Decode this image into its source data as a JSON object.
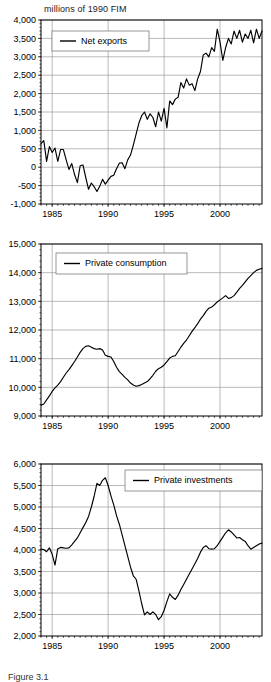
{
  "figure": {
    "axis_units_title": "millions of 1990 FIM",
    "caption": "Figure 3.1"
  },
  "chart_data": [
    {
      "type": "line",
      "title": "millions of 1990 FIM",
      "xlabel": "",
      "ylabel": "millions of 1990 FIM",
      "grid": true,
      "legend_position": "top-left",
      "legend": [
        "Net exports"
      ],
      "xlim": [
        1984.0,
        2003.75
      ],
      "ylim": [
        -1000,
        4000
      ],
      "yticks": [
        -1000,
        -500,
        0,
        500,
        1000,
        1500,
        2000,
        2500,
        3000,
        3500,
        4000
      ],
      "ytick_labels": [
        "-1,000",
        "-500",
        "0",
        "500",
        "1,000",
        "1,500",
        "2,000",
        "2,500",
        "3,000",
        "3,500",
        "4,000"
      ],
      "xticks": [
        1985,
        1990,
        1995,
        2000
      ],
      "xtick_labels": [
        "1985",
        "1990",
        "1995",
        "2000"
      ],
      "series": [
        {
          "name": "Net exports",
          "x": [
            1984.0,
            1984.25,
            1984.5,
            1984.75,
            1985.0,
            1985.25,
            1985.5,
            1985.75,
            1986.0,
            1986.25,
            1986.5,
            1986.75,
            1987.0,
            1987.25,
            1987.5,
            1987.75,
            1988.0,
            1988.25,
            1988.5,
            1988.75,
            1989.0,
            1989.25,
            1989.5,
            1989.75,
            1990.0,
            1990.25,
            1990.5,
            1990.75,
            1991.0,
            1991.25,
            1991.5,
            1991.75,
            1992.0,
            1992.25,
            1992.5,
            1992.75,
            1993.0,
            1993.25,
            1993.5,
            1993.75,
            1994.0,
            1994.25,
            1994.5,
            1994.75,
            1995.0,
            1995.25,
            1995.5,
            1995.75,
            1996.0,
            1996.25,
            1996.5,
            1996.75,
            1997.0,
            1997.25,
            1997.5,
            1997.75,
            1998.0,
            1998.25,
            1998.5,
            1998.75,
            1999.0,
            1999.25,
            1999.5,
            1999.75,
            2000.0,
            2000.25,
            2000.5,
            2000.75,
            2001.0,
            2001.25,
            2001.5,
            2001.75,
            2002.0,
            2002.25,
            2002.5,
            2002.75,
            2003.0,
            2003.25,
            2003.5,
            2003.75
          ],
          "values": [
            640,
            720,
            160,
            560,
            400,
            520,
            160,
            480,
            480,
            200,
            -60,
            100,
            -200,
            -420,
            40,
            60,
            -280,
            -600,
            -430,
            -530,
            -660,
            -520,
            -330,
            -460,
            -350,
            -250,
            -220,
            -40,
            110,
            120,
            -40,
            200,
            330,
            600,
            900,
            1200,
            1400,
            1500,
            1300,
            1450,
            1350,
            1100,
            1500,
            1250,
            1600,
            1070,
            1800,
            1700,
            1850,
            1900,
            2300,
            2150,
            2400,
            2230,
            2270,
            2080,
            2400,
            2600,
            3050,
            3100,
            3000,
            3250,
            3150,
            3750,
            3400,
            2900,
            3250,
            3500,
            3350,
            3700,
            3500,
            3720,
            3400,
            3620,
            3500,
            3720,
            3380,
            3750,
            3500,
            3700
          ]
        }
      ]
    },
    {
      "type": "line",
      "title": "",
      "xlabel": "",
      "ylabel": "millions of 1990 FIM",
      "grid": true,
      "legend_position": "top-left",
      "legend": [
        "Private consumption"
      ],
      "xlim": [
        1984.0,
        2003.75
      ],
      "ylim": [
        9000,
        15000
      ],
      "yticks": [
        9000,
        10000,
        11000,
        12000,
        13000,
        14000,
        15000
      ],
      "ytick_labels": [
        "9,000",
        "10,000",
        "11,000",
        "12,000",
        "13,000",
        "14,000",
        "15,000"
      ],
      "xticks": [
        1985,
        1990,
        1995,
        2000
      ],
      "xtick_labels": [
        "1985",
        "1990",
        "1995",
        "2000"
      ],
      "series": [
        {
          "name": "Private consumption",
          "x": [
            1984.0,
            1984.25,
            1984.5,
            1984.75,
            1985.0,
            1985.25,
            1985.5,
            1985.75,
            1986.0,
            1986.25,
            1986.5,
            1986.75,
            1987.0,
            1987.25,
            1987.5,
            1987.75,
            1988.0,
            1988.25,
            1988.5,
            1988.75,
            1989.0,
            1989.25,
            1989.5,
            1989.75,
            1990.0,
            1990.25,
            1990.5,
            1990.75,
            1991.0,
            1991.25,
            1991.5,
            1991.75,
            1992.0,
            1992.25,
            1992.5,
            1992.75,
            1993.0,
            1993.25,
            1993.5,
            1993.75,
            1994.0,
            1994.25,
            1994.5,
            1994.75,
            1995.0,
            1995.25,
            1995.5,
            1995.75,
            1996.0,
            1996.25,
            1996.5,
            1996.75,
            1997.0,
            1997.25,
            1997.5,
            1997.75,
            1998.0,
            1998.25,
            1998.5,
            1998.75,
            1999.0,
            1999.25,
            1999.5,
            1999.75,
            2000.0,
            2000.25,
            2000.5,
            2000.75,
            2001.0,
            2001.25,
            2001.5,
            2001.75,
            2002.0,
            2002.25,
            2002.5,
            2002.75,
            2003.0,
            2003.25,
            2003.5,
            2003.75
          ],
          "values": [
            9380,
            9420,
            9560,
            9700,
            9860,
            9980,
            10080,
            10200,
            10350,
            10500,
            10620,
            10760,
            10900,
            11060,
            11220,
            11350,
            11430,
            11450,
            11400,
            11350,
            11330,
            11350,
            11300,
            11120,
            11080,
            11060,
            10900,
            10700,
            10550,
            10450,
            10350,
            10260,
            10150,
            10080,
            10040,
            10060,
            10100,
            10150,
            10200,
            10300,
            10420,
            10560,
            10650,
            10700,
            10780,
            10900,
            11020,
            11080,
            11100,
            11250,
            11400,
            11530,
            11650,
            11800,
            11950,
            12080,
            12220,
            12380,
            12500,
            12650,
            12760,
            12800,
            12880,
            12980,
            13050,
            13120,
            13200,
            13100,
            13130,
            13200,
            13320,
            13450,
            13560,
            13680,
            13800,
            13900,
            14000,
            14080,
            14120,
            14150
          ]
        }
      ]
    },
    {
      "type": "line",
      "title": "",
      "xlabel": "",
      "ylabel": "millions of 1990 FIM",
      "grid": true,
      "legend_position": "top-right",
      "legend": [
        "Private investments"
      ],
      "xlim": [
        1984.0,
        2003.75
      ],
      "ylim": [
        2000,
        6000
      ],
      "yticks": [
        2000,
        2500,
        3000,
        3500,
        4000,
        4500,
        5000,
        5500,
        6000
      ],
      "ytick_labels": [
        "2,000",
        "2,500",
        "3,000",
        "3,500",
        "4,000",
        "4,500",
        "5,000",
        "5,500",
        "6,000"
      ],
      "xticks": [
        1985,
        1990,
        1995,
        2000
      ],
      "xtick_labels": [
        "1985",
        "1990",
        "1995",
        "2000"
      ],
      "series": [
        {
          "name": "Private investments",
          "x": [
            1984.0,
            1984.25,
            1984.5,
            1984.75,
            1985.0,
            1985.25,
            1985.5,
            1985.75,
            1986.0,
            1986.25,
            1986.5,
            1986.75,
            1987.0,
            1987.25,
            1987.5,
            1987.75,
            1988.0,
            1988.25,
            1988.5,
            1988.75,
            1989.0,
            1989.25,
            1989.5,
            1989.75,
            1990.0,
            1990.25,
            1990.5,
            1990.75,
            1991.0,
            1991.25,
            1991.5,
            1991.75,
            1992.0,
            1992.25,
            1992.5,
            1992.75,
            1993.0,
            1993.25,
            1993.5,
            1993.75,
            1994.0,
            1994.25,
            1994.5,
            1994.75,
            1995.0,
            1995.25,
            1995.5,
            1995.75,
            1996.0,
            1996.25,
            1996.5,
            1996.75,
            1997.0,
            1997.25,
            1997.5,
            1997.75,
            1998.0,
            1998.25,
            1998.5,
            1998.75,
            1999.0,
            1999.25,
            1999.5,
            1999.75,
            2000.0,
            2000.25,
            2000.5,
            2000.75,
            2001.0,
            2001.25,
            2001.5,
            2001.75,
            2002.0,
            2002.25,
            2002.5,
            2002.75,
            2003.0,
            2003.25,
            2003.5,
            2003.75
          ],
          "values": [
            4020,
            4010,
            3960,
            4050,
            3900,
            3650,
            4030,
            4060,
            4050,
            4040,
            4050,
            4120,
            4200,
            4280,
            4400,
            4520,
            4640,
            4780,
            5000,
            5250,
            5550,
            5500,
            5620,
            5680,
            5500,
            5260,
            5050,
            4800,
            4600,
            4350,
            4100,
            3850,
            3600,
            3400,
            3320,
            3050,
            2750,
            2490,
            2560,
            2500,
            2560,
            2500,
            2380,
            2450,
            2600,
            2800,
            2980,
            2900,
            2850,
            2950,
            3080,
            3200,
            3320,
            3440,
            3560,
            3680,
            3800,
            3950,
            4060,
            4100,
            4030,
            4020,
            4030,
            4100,
            4200,
            4300,
            4400,
            4470,
            4420,
            4350,
            4280,
            4290,
            4240,
            4200,
            4100,
            4020,
            4060,
            4100,
            4140,
            4160
          ]
        }
      ]
    }
  ]
}
